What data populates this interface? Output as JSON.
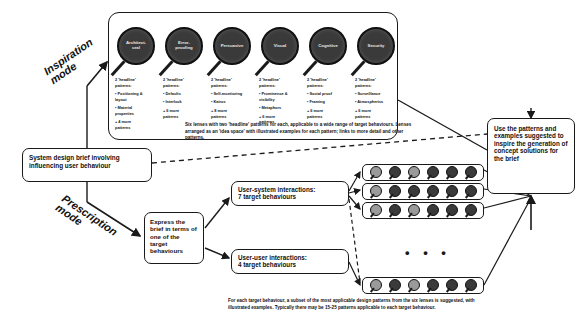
{
  "diagram": {
    "modes": {
      "inspiration": "Inspiration\nmode",
      "prescription": "Prescription\nmode"
    },
    "lenses": [
      {
        "name": "Architect-\nural",
        "headline_label": "2 'headline'\npatterns:",
        "patterns": [
          "• Positioning &\nlayout",
          "• Material\nproperties"
        ],
        "more": "+ 4 more\npatterns"
      },
      {
        "name": "Error-\nproofing",
        "headline_label": "2 'headline'\npatterns:",
        "patterns": [
          "• Defaults",
          "• Interlock"
        ],
        "more": "+ 6 more\npatterns"
      },
      {
        "name": "Persuasive",
        "headline_label": "2 'headline'\npatterns:",
        "patterns": [
          "• Self-monitoring",
          "• Kairos"
        ],
        "more": "+ 8 more\npatterns"
      },
      {
        "name": "Visual",
        "headline_label": "2 'headline'\npatterns:",
        "patterns": [
          "• Prominence &\nvisibility",
          "• Metaphors"
        ],
        "more": "+ 6 more\npatterns"
      },
      {
        "name": "Cognitive",
        "headline_label": "2 'headline'\npatterns:",
        "patterns": [
          "• Social proof",
          "• Framing"
        ],
        "more": "+ 6 more\npatterns"
      },
      {
        "name": "Security",
        "headline_label": "2 'headline'\npatterns:",
        "patterns": [
          "• Surveillance",
          "• Atmospherics"
        ],
        "more": "+ 6 more\npatterns"
      }
    ],
    "caption_top": "Six lenses with two 'headline' patterns for each, applicable to a wide range of target behaviours. Lenses arranged as an 'idea space' with illustrated examples for each pattern; links to more detail and other patterns.",
    "caption_bottom": "For each target behaviour, a subset of the most applicable design patterns from the six lenses is suggested, with illustrated examples. Typically there may be 15-25 patterns applicable to each target behaviour.",
    "boxes": {
      "brief": "System design brief involving influencing user behaviour",
      "express": "Express the brief in terms of one of the target behaviours",
      "user_system": "User-system interactions:\n7 target behaviours",
      "user_user": "User-user interactions:\n4 target behaviours",
      "use_patterns": "Use the patterns and examples suggested to inspire the generation of concept solutions for the brief"
    },
    "pattern_rows": [
      {
        "id": "row-1",
        "count": 6,
        "highlight": [
          0,
          2
        ]
      },
      {
        "id": "row-2",
        "count": 6,
        "highlight": [
          0
        ]
      },
      {
        "id": "row-3",
        "count": 6,
        "highlight": [
          0,
          2
        ]
      },
      {
        "id": "row-4",
        "count": 6,
        "highlight": [
          0,
          2
        ]
      }
    ],
    "ellipsis": "• • •",
    "colors": {
      "lens_dark": "#3a3a3a",
      "lens_light": "#9a9a9a",
      "stroke": "#1a1a1a",
      "background": "#ffffff"
    }
  }
}
